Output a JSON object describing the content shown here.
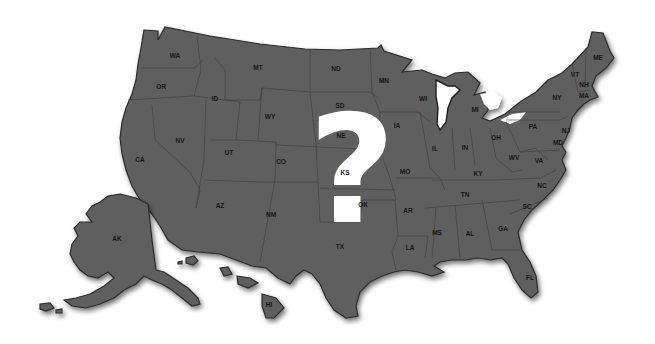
{
  "map": {
    "title": "United States map with unknown state",
    "overlay_symbol": "?",
    "colors": {
      "land": "#5f5f5f",
      "border": "#2c2c2c",
      "label": "#151515",
      "question_mark": "#ffffff",
      "background": "#ffffff"
    },
    "state_labels": [
      {
        "abbr": "WA",
        "x": 175,
        "y": 58
      },
      {
        "abbr": "OR",
        "x": 161,
        "y": 89
      },
      {
        "abbr": "CA",
        "x": 140,
        "y": 162
      },
      {
        "abbr": "NV",
        "x": 180,
        "y": 143
      },
      {
        "abbr": "ID",
        "x": 215,
        "y": 101
      },
      {
        "abbr": "MT",
        "x": 258,
        "y": 70
      },
      {
        "abbr": "WY",
        "x": 270,
        "y": 119
      },
      {
        "abbr": "UT",
        "x": 229,
        "y": 155
      },
      {
        "abbr": "CO",
        "x": 281,
        "y": 164
      },
      {
        "abbr": "AZ",
        "x": 220,
        "y": 208
      },
      {
        "abbr": "NM",
        "x": 271,
        "y": 217
      },
      {
        "abbr": "ND",
        "x": 336,
        "y": 71
      },
      {
        "abbr": "SD",
        "x": 340,
        "y": 108
      },
      {
        "abbr": "NE",
        "x": 341,
        "y": 138
      },
      {
        "abbr": "KS",
        "x": 345,
        "y": 175
      },
      {
        "abbr": "OK",
        "x": 363,
        "y": 207
      },
      {
        "abbr": "TX",
        "x": 340,
        "y": 249
      },
      {
        "abbr": "MN",
        "x": 384,
        "y": 83
      },
      {
        "abbr": "IA",
        "x": 397,
        "y": 128
      },
      {
        "abbr": "MO",
        "x": 405,
        "y": 174
      },
      {
        "abbr": "AR",
        "x": 408,
        "y": 213
      },
      {
        "abbr": "LA",
        "x": 410,
        "y": 250
      },
      {
        "abbr": "WI",
        "x": 423,
        "y": 101
      },
      {
        "abbr": "IL",
        "x": 435,
        "y": 151
      },
      {
        "abbr": "MI",
        "x": 475,
        "y": 112
      },
      {
        "abbr": "IN",
        "x": 465,
        "y": 150
      },
      {
        "abbr": "OH",
        "x": 496,
        "y": 140
      },
      {
        "abbr": "KY",
        "x": 478,
        "y": 176
      },
      {
        "abbr": "TN",
        "x": 465,
        "y": 197
      },
      {
        "abbr": "MS",
        "x": 437,
        "y": 235
      },
      {
        "abbr": "AL",
        "x": 470,
        "y": 236
      },
      {
        "abbr": "GA",
        "x": 503,
        "y": 231
      },
      {
        "abbr": "FL",
        "x": 530,
        "y": 280
      },
      {
        "abbr": "SC",
        "x": 527,
        "y": 209
      },
      {
        "abbr": "NC",
        "x": 542,
        "y": 188
      },
      {
        "abbr": "VA",
        "x": 539,
        "y": 163
      },
      {
        "abbr": "WV",
        "x": 514,
        "y": 160
      },
      {
        "abbr": "PA",
        "x": 533,
        "y": 129
      },
      {
        "abbr": "NY",
        "x": 557,
        "y": 100
      },
      {
        "abbr": "VT",
        "x": 575,
        "y": 77
      },
      {
        "abbr": "NH",
        "x": 584,
        "y": 87
      },
      {
        "abbr": "MA",
        "x": 584,
        "y": 98
      },
      {
        "abbr": "ME",
        "x": 598,
        "y": 60
      },
      {
        "abbr": "NJ",
        "x": 566,
        "y": 133
      },
      {
        "abbr": "MD",
        "x": 558,
        "y": 145
      },
      {
        "abbr": "AK",
        "x": 117,
        "y": 241
      },
      {
        "abbr": "HI",
        "x": 269,
        "y": 307
      }
    ]
  }
}
